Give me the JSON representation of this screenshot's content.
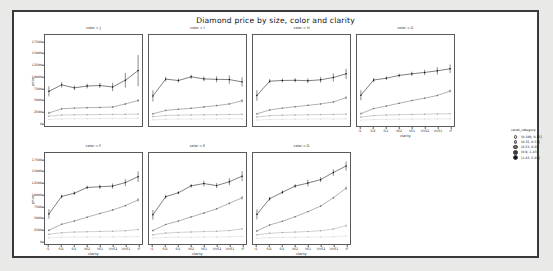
{
  "figure": {
    "title": "Diamond price by size, color and clarity",
    "background": "#ffffff",
    "page_background": "#e9e9e7",
    "border_color": "#3a3a3c"
  },
  "legend": {
    "title": "carat_category",
    "entries": [
      {
        "label": "(0.199, 0.35]",
        "color": "#d9d9d9"
      },
      {
        "label": "(0.35, 0.53]",
        "color": "#a8a8a8"
      },
      {
        "label": "(0.53, 0.9]",
        "color": "#6e6e6e"
      },
      {
        "label": "(0.9, 1.43]",
        "color": "#3b3b3b"
      },
      {
        "label": "(1.43, 5.01]",
        "color": "#111111"
      }
    ]
  },
  "chart_data": {
    "type": "line",
    "title": "Diamond price by size, color and clarity",
    "xlabel": "clarity",
    "ylabel": "price",
    "grid": false,
    "legend_position": "right",
    "facet_variable": "color",
    "x": [
      "I1",
      "SI2",
      "SI1",
      "VS2",
      "VS1",
      "VVS2",
      "VVS1",
      "IF"
    ],
    "ylim": [
      0,
      18500
    ],
    "yticks": [
      0,
      2500,
      5000,
      7500,
      10000,
      12500,
      15000,
      17500
    ],
    "ytick_labels": [
      "0",
      "2500",
      "5000",
      "7500",
      "10000",
      "12500",
      "15000",
      "17500"
    ],
    "facets": [
      {
        "name": "color = J",
        "series": [
          {
            "name": "(0.199, 0.35]",
            "color": "#d9d9d9",
            "values": [
              760,
              900,
              940,
              960,
              980,
              1000,
              1010,
              1030
            ],
            "err": [
              120,
              70,
              50,
              50,
              50,
              60,
              70,
              90
            ]
          },
          {
            "name": "(0.35, 0.53]",
            "color": "#a8a8a8",
            "values": [
              1500,
              1750,
              1800,
              1830,
              1850,
              1880,
              1900,
              1950
            ],
            "err": [
              180,
              90,
              70,
              70,
              70,
              80,
              90,
              130
            ]
          },
          {
            "name": "(0.53, 0.9]",
            "color": "#6e6e6e",
            "values": [
              2200,
              3100,
              3250,
              3350,
              3400,
              3500,
              4150,
              4900
            ],
            "err": [
              260,
              140,
              110,
              110,
              120,
              160,
              230,
              330
            ]
          },
          {
            "name": "(1.43, 5.01]",
            "color": "#111111",
            "values": [
              6900,
              8300,
              7650,
              8050,
              8150,
              7850,
              9300,
              11400
            ],
            "err": [
              1100,
              600,
              500,
              520,
              560,
              900,
              1600,
              3400
            ]
          }
        ]
      },
      {
        "name": "color = I",
        "series": [
          {
            "name": "(0.199, 0.35]",
            "color": "#d9d9d9",
            "values": [
              700,
              830,
              860,
              880,
              900,
              920,
              930,
              950
            ],
            "err": [
              110,
              60,
              45,
              45,
              45,
              55,
              60,
              80
            ]
          },
          {
            "name": "(0.35, 0.53]",
            "color": "#a8a8a8",
            "values": [
              1400,
              1650,
              1720,
              1760,
              1790,
              1820,
              1860,
              1900
            ],
            "err": [
              170,
              80,
              60,
              60,
              65,
              75,
              85,
              110
            ]
          },
          {
            "name": "(0.53, 0.9]",
            "color": "#6e6e6e",
            "values": [
              2000,
              2750,
              3000,
              3200,
              3500,
              3800,
              4150,
              4850
            ],
            "err": [
              240,
              120,
              100,
              100,
              120,
              150,
              210,
              400
            ]
          },
          {
            "name": "(1.43, 5.01]",
            "color": "#111111",
            "values": [
              5900,
              9550,
              9250,
              10050,
              9600,
              9500,
              9450,
              8950
            ],
            "err": [
              1200,
              500,
              420,
              450,
              520,
              650,
              900,
              1000
            ]
          }
        ]
      },
      {
        "name": "color = H",
        "series": [
          {
            "name": "(0.199, 0.35]",
            "color": "#d9d9d9",
            "values": [
              650,
              790,
              820,
              845,
              865,
              885,
              900,
              920
            ],
            "err": [
              100,
              55,
              40,
              40,
              42,
              50,
              55,
              75
            ]
          },
          {
            "name": "(0.35, 0.53]",
            "color": "#a8a8a8",
            "values": [
              1320,
              1600,
              1700,
              1760,
              1800,
              1840,
              1880,
              1950
            ],
            "err": [
              160,
              75,
              55,
              55,
              60,
              70,
              80,
              110
            ]
          },
          {
            "name": "(0.53, 0.9]",
            "color": "#6e6e6e",
            "values": [
              2000,
              2850,
              3250,
              3550,
              3850,
              4150,
              4600,
              5500
            ],
            "err": [
              230,
              115,
              95,
              100,
              110,
              140,
              200,
              350
            ]
          },
          {
            "name": "(1.43, 5.01]",
            "color": "#111111",
            "values": [
              6000,
              9100,
              9250,
              9300,
              9200,
              9400,
              9900,
              10700
            ],
            "err": [
              1150,
              480,
              400,
              430,
              500,
              620,
              900,
              1100
            ]
          }
        ]
      },
      {
        "name": "color = G",
        "series": [
          {
            "name": "(0.199, 0.35]",
            "color": "#d9d9d9",
            "values": [
              640,
              770,
              810,
              840,
              860,
              880,
              900,
              930
            ],
            "err": [
              95,
              50,
              38,
              38,
              40,
              48,
              52,
              70
            ]
          },
          {
            "name": "(0.35, 0.53]",
            "color": "#a8a8a8",
            "values": [
              1300,
              1620,
              1740,
              1820,
              1880,
              1930,
              1980,
              2050
            ],
            "err": [
              150,
              70,
              52,
              52,
              58,
              68,
              78,
              105
            ]
          },
          {
            "name": "(0.53, 0.9]",
            "color": "#6e6e6e",
            "values": [
              2050,
              3150,
              3700,
              4300,
              4900,
              5400,
              6000,
              6950
            ],
            "err": [
              225,
              110,
              92,
              95,
              105,
              135,
              190,
              330
            ]
          },
          {
            "name": "(1.43, 5.01]",
            "color": "#111111",
            "values": [
              6050,
              9350,
              9750,
              10350,
              10700,
              11000,
              11350,
              11800
            ],
            "err": [
              1100,
              450,
              380,
              400,
              460,
              580,
              800,
              950
            ]
          }
        ]
      },
      {
        "name": "color = F",
        "series": [
          {
            "name": "(0.199, 0.35]",
            "color": "#d9d9d9",
            "values": [
              700,
              830,
              860,
              880,
              895,
              910,
              930,
              1000
            ],
            "err": [
              100,
              55,
              40,
              40,
              42,
              50,
              58,
              90
            ]
          },
          {
            "name": "(0.35, 0.53]",
            "color": "#a8a8a8",
            "values": [
              1480,
              1820,
              1950,
              2030,
              2090,
              2140,
              2250,
              2500
            ],
            "err": [
              160,
              75,
              58,
              58,
              62,
              75,
              95,
              160
            ]
          },
          {
            "name": "(0.53, 0.9]",
            "color": "#6e6e6e",
            "values": [
              2350,
              3650,
              4350,
              5200,
              6000,
              6750,
              7700,
              8950
            ],
            "err": [
              240,
              120,
              100,
              105,
              115,
              150,
              220,
              400
            ]
          },
          {
            "name": "(1.43, 5.01]",
            "color": "#111111",
            "values": [
              5900,
              9700,
              10400,
              11650,
              11800,
              11950,
              12700,
              14000
            ],
            "err": [
              1050,
              430,
              360,
              390,
              450,
              560,
              780,
              1150
            ]
          }
        ]
      },
      {
        "name": "color = E",
        "series": [
          {
            "name": "(0.199, 0.35]",
            "color": "#d9d9d9",
            "values": [
              640,
              790,
              830,
              855,
              875,
              900,
              930,
              1020
            ],
            "err": [
              95,
              50,
              38,
              38,
              42,
              50,
              60,
              95
            ]
          },
          {
            "name": "(0.35, 0.53]",
            "color": "#a8a8a8",
            "values": [
              1380,
              1740,
              1890,
              1980,
              2060,
              2130,
              2280,
              2650
            ],
            "err": [
              150,
              70,
              55,
              55,
              60,
              72,
              95,
              180
            ]
          },
          {
            "name": "(0.53, 0.9]",
            "color": "#6e6e6e",
            "values": [
              2280,
              3600,
              4350,
              5250,
              6100,
              7000,
              8200,
              9400
            ],
            "err": [
              235,
              115,
              98,
              100,
              115,
              150,
              230,
              420
            ]
          },
          {
            "name": "(1.43, 5.01]",
            "color": "#111111",
            "values": [
              5700,
              9650,
              10500,
              12000,
              12500,
              12050,
              12900,
              14100
            ],
            "err": [
              1050,
              420,
              350,
              380,
              620,
              540,
              760,
              1100
            ]
          }
        ]
      },
      {
        "name": "color = D",
        "series": [
          {
            "name": "(0.199, 0.35]",
            "color": "#d9d9d9",
            "values": [
              620,
              760,
              800,
              830,
              860,
              900,
              950,
              1100
            ],
            "err": [
              90,
              48,
              36,
              36,
              40,
              50,
              65,
              110
            ]
          },
          {
            "name": "(0.35, 0.53]",
            "color": "#a8a8a8",
            "values": [
              1350,
              1700,
              1850,
              1950,
              2080,
              2250,
              2600,
              3350
            ],
            "err": [
              145,
              68,
              52,
              52,
              58,
              75,
              110,
              260
            ]
          },
          {
            "name": "(0.53, 0.9]",
            "color": "#6e6e6e",
            "values": [
              2200,
              3500,
              4300,
              5300,
              6400,
              7600,
              9400,
              11500
            ],
            "err": [
              230,
              110,
              95,
              100,
              115,
              155,
              250,
              480
            ]
          },
          {
            "name": "(1.43, 5.01]",
            "color": "#111111",
            "values": [
              5800,
              9200,
              10600,
              11950,
              12600,
              13350,
              14900,
              16300
            ],
            "err": [
              1100,
              430,
              360,
              400,
              700,
              520,
              720,
              980
            ]
          }
        ]
      }
    ]
  }
}
